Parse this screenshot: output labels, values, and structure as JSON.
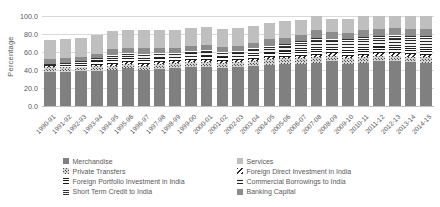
{
  "chart_data": {
    "type": "bar",
    "stacked": true,
    "title": "",
    "xlabel": "",
    "ylabel": "Percentage",
    "ylim": [
      0,
      100
    ],
    "yticks": [
      "0.0",
      "20.0",
      "40.0",
      "60.0",
      "80.0",
      "100.0"
    ],
    "ytick_values": [
      0,
      20,
      40,
      60,
      80,
      100
    ],
    "grid": true,
    "legend_position": "bottom",
    "categories": [
      "1990-91",
      "1991-92",
      "1992-93",
      "1993-94",
      "1994-95",
      "1995-96",
      "1996-97",
      "1997-98",
      "1998-99",
      "1999-00",
      "2000-01",
      "2001-02",
      "2002-03",
      "2003-04",
      "2004-05",
      "2005-06",
      "2006-07",
      "2007-08",
      "2008-09",
      "2009-10",
      "2010-11",
      "2011-12",
      "2012-13",
      "2013-14",
      "2014-15"
    ],
    "series": [
      {
        "name": "Merchandise",
        "pattern": "solid-dark-gray",
        "color": "#808080",
        "values": [
          38,
          38,
          39,
          39,
          40,
          42,
          40,
          41,
          42,
          43,
          43,
          42,
          43,
          44,
          46,
          47,
          47,
          48,
          50,
          47,
          48,
          50,
          50,
          49,
          48
        ]
      },
      {
        "name": "Private Transfers",
        "pattern": "dotted",
        "color": "#d9d9d9",
        "values": [
          5,
          5,
          5,
          5,
          5,
          5,
          5,
          6,
          6,
          6,
          6,
          6,
          6,
          6,
          6,
          6,
          6,
          6,
          6,
          6,
          6,
          6,
          6,
          6,
          6
        ]
      },
      {
        "name": "Foreign Direct Investment in India",
        "pattern": "diagonal-hatch",
        "color": "#ffffff",
        "values": [
          1,
          1,
          1,
          2,
          2,
          2,
          2,
          2,
          2,
          2,
          2,
          2,
          2,
          2,
          2,
          2,
          3,
          3,
          3,
          3,
          3,
          3,
          3,
          3,
          3
        ]
      },
      {
        "name": "Foreign Portfolio Investment in India",
        "pattern": "horizontal-lines-dense",
        "color": "#ffffff",
        "values": [
          0,
          1,
          2,
          4,
          5,
          5,
          5,
          4,
          3,
          4,
          5,
          4,
          4,
          6,
          5,
          6,
          7,
          8,
          6,
          8,
          8,
          7,
          8,
          8,
          8
        ]
      },
      {
        "name": "Commercial Borrowings to India",
        "pattern": "horizontal-lines",
        "color": "#f2f2f2",
        "values": [
          2,
          2,
          2,
          2,
          3,
          3,
          4,
          4,
          4,
          4,
          4,
          4,
          4,
          4,
          5,
          5,
          6,
          7,
          7,
          7,
          8,
          8,
          8,
          8,
          9
        ]
      },
      {
        "name": "Short Term Credit to India",
        "pattern": "horizontal-lines-fine",
        "color": "#ffffff",
        "values": [
          1,
          1,
          1,
          1,
          2,
          2,
          2,
          2,
          2,
          2,
          2,
          2,
          2,
          2,
          3,
          3,
          3,
          4,
          3,
          3,
          4,
          4,
          4,
          4,
          4
        ]
      },
      {
        "name": "Banking Capital",
        "pattern": "solid-mid-gray",
        "color": "#8c8c8c",
        "values": [
          5,
          5,
          5,
          5,
          6,
          6,
          6,
          6,
          6,
          6,
          6,
          6,
          6,
          6,
          7,
          7,
          7,
          8,
          7,
          7,
          8,
          8,
          8,
          8,
          8
        ]
      },
      {
        "name": "Services",
        "pattern": "solid-light-gray",
        "color": "#bfbfbf",
        "values": [
          21,
          21,
          21,
          21,
          20,
          19,
          20,
          20,
          20,
          20,
          20,
          20,
          20,
          19,
          18,
          18,
          17,
          16,
          15,
          16,
          15,
          14,
          13,
          14,
          14
        ]
      }
    ]
  },
  "legend": {
    "left_column": [
      {
        "label": "Merchandise",
        "key": "merch"
      },
      {
        "label": "Private Transfers",
        "key": "transf"
      },
      {
        "label": "Foreign Portfolio Investment in India",
        "key": "fpi"
      },
      {
        "label": "Short Term Credit to India",
        "key": "stc"
      }
    ],
    "right_column": [
      {
        "label": "Services",
        "key": "serv"
      },
      {
        "label": "Foreign Direct Investment in India",
        "key": "fdi"
      },
      {
        "label": "Commercial Borrowings to India",
        "key": "ecb"
      },
      {
        "label": "Banking Capital",
        "key": "bank"
      }
    ]
  },
  "colors": {
    "merchandise": "#808080",
    "services": "#bfbfbf",
    "banking_capital": "#8c8c8c",
    "private_transfers": "#d9d9d9",
    "grid": "#d9d9d9",
    "text": "#595959"
  }
}
